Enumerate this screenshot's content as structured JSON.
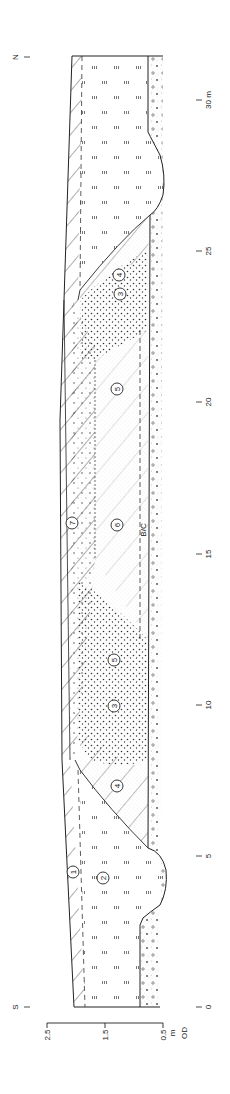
{
  "figure": {
    "type": "archaeological-section",
    "orientation": "rotated-90",
    "ends": {
      "south": "S",
      "north": "N"
    }
  },
  "horizontal_scale": {
    "unit": "m",
    "ticks": [
      {
        "label": "0",
        "y": 1007
      },
      {
        "label": "5",
        "y": 856
      },
      {
        "label": "10",
        "y": 705
      },
      {
        "label": "15",
        "y": 554
      },
      {
        "label": "20",
        "y": 402
      },
      {
        "label": "25",
        "y": 251
      },
      {
        "label": "30 m",
        "y": 100
      }
    ]
  },
  "vertical_scale": {
    "unit_label": "m",
    "datum_label": "OD",
    "ticks": [
      {
        "label": "2.5",
        "x": 47
      },
      {
        "label": "1.5",
        "x": 105
      },
      {
        "label": "0.5",
        "x": 163
      }
    ]
  },
  "layers": [
    {
      "id": "1",
      "x": 73,
      "y": 872
    },
    {
      "id": "2",
      "x": 103,
      "y": 878
    },
    {
      "id": "3",
      "x": 120,
      "y": 294
    },
    {
      "id": "4",
      "x": 119,
      "y": 275
    },
    {
      "id": "5",
      "x": 117,
      "y": 389
    },
    {
      "id": "6",
      "x": 117,
      "y": 525
    },
    {
      "id": "7",
      "x": 72,
      "y": 523
    },
    {
      "id": "3",
      "x": 114,
      "y": 836,
      "alt": "layer-3-south"
    },
    {
      "id": "4",
      "x": 117,
      "y": 786,
      "alt": "layer-4-south"
    },
    {
      "id": "5",
      "x": 114,
      "y": 660,
      "alt": "layer-5-south"
    }
  ],
  "annotations": {
    "bc_label": "B/C"
  },
  "colors": {
    "line": "#222222",
    "stipple": "#888888"
  }
}
